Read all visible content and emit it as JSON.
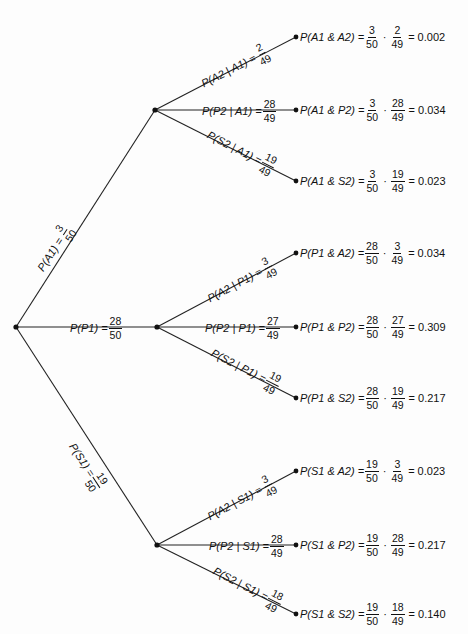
{
  "diagram": {
    "type": "probability-tree",
    "root": {
      "x": 16,
      "y": 327
    },
    "level1": [
      {
        "id": "A1",
        "node": {
          "x": 155,
          "y": 110
        },
        "label": {
          "prefix": "P(A1) =",
          "num": "3",
          "den": "50"
        }
      },
      {
        "id": "P1",
        "node": {
          "x": 157,
          "y": 327
        },
        "label": {
          "prefix": "P(P1) =",
          "num": "28",
          "den": "50"
        }
      },
      {
        "id": "S1",
        "node": {
          "x": 157,
          "y": 545
        },
        "label": {
          "prefix": "P(S1) =",
          "num": "19",
          "den": "50"
        }
      }
    ],
    "level2": [
      {
        "parent": "A1",
        "leaf": {
          "x": 296,
          "y": 37
        },
        "label": {
          "prefix": "P(A2 | A1) =",
          "num": "2",
          "den": "49"
        },
        "outcome": {
          "event": "P(A1 & A2) =",
          "f1n": "3",
          "f1d": "50",
          "f2n": "2",
          "f2d": "49",
          "result": "= 0.002"
        }
      },
      {
        "parent": "A1",
        "leaf": {
          "x": 296,
          "y": 110
        },
        "label": {
          "prefix": "P(P2 | A1) =",
          "num": "28",
          "den": "49"
        },
        "outcome": {
          "event": "P(A1 & P2) =",
          "f1n": "3",
          "f1d": "50",
          "f2n": "28",
          "f2d": "49",
          "result": "= 0.034"
        }
      },
      {
        "parent": "A1",
        "leaf": {
          "x": 296,
          "y": 181
        },
        "label": {
          "prefix": "P(S2 | A1) =",
          "num": "19",
          "den": "49"
        },
        "outcome": {
          "event": "P(A1 & S2) =",
          "f1n": "3",
          "f1d": "50",
          "f2n": "19",
          "f2d": "49",
          "result": "= 0.023"
        }
      },
      {
        "parent": "P1",
        "leaf": {
          "x": 296,
          "y": 253
        },
        "label": {
          "prefix": "P(A2 | P1) =",
          "num": "3",
          "den": "49"
        },
        "outcome": {
          "event": "P(P1 & A2) =",
          "f1n": "28",
          "f1d": "50",
          "f2n": "3",
          "f2d": "49",
          "result": "= 0.034"
        }
      },
      {
        "parent": "P1",
        "leaf": {
          "x": 296,
          "y": 327
        },
        "label": {
          "prefix": "P(P2 | P1) =",
          "num": "27",
          "den": "49"
        },
        "outcome": {
          "event": "P(P1 & P2) =",
          "f1n": "28",
          "f1d": "50",
          "f2n": "27",
          "f2d": "49",
          "result": "= 0.309"
        }
      },
      {
        "parent": "P1",
        "leaf": {
          "x": 296,
          "y": 398
        },
        "label": {
          "prefix": "P(S2 | P1) =",
          "num": "19",
          "den": "49"
        },
        "outcome": {
          "event": "P(P1 & S2) =",
          "f1n": "28",
          "f1d": "50",
          "f2n": "19",
          "f2d": "49",
          "result": "= 0.217"
        }
      },
      {
        "parent": "S1",
        "leaf": {
          "x": 296,
          "y": 471
        },
        "label": {
          "prefix": "P(A2 | S1) =",
          "num": "3",
          "den": "49"
        },
        "outcome": {
          "event": "P(S1 & A2) =",
          "f1n": "19",
          "f1d": "50",
          "f2n": "3",
          "f2d": "49",
          "result": "= 0.023"
        }
      },
      {
        "parent": "S1",
        "leaf": {
          "x": 296,
          "y": 545
        },
        "label": {
          "prefix": "P(P2 | S1) =",
          "num": "28",
          "den": "49"
        },
        "outcome": {
          "event": "P(S1 & P2) =",
          "f1n": "19",
          "f1d": "50",
          "f2n": "28",
          "f2d": "49",
          "result": "= 0.217"
        }
      },
      {
        "parent": "S1",
        "leaf": {
          "x": 296,
          "y": 614
        },
        "label": {
          "prefix": "P(S2 | S1) =",
          "num": "18",
          "den": "49"
        },
        "outcome": {
          "event": "P(S1 & S2) =",
          "f1n": "19",
          "f1d": "50",
          "f2n": "18",
          "f2d": "49",
          "result": "= 0.140"
        }
      }
    ],
    "colors": {
      "line": "#222222",
      "background": "#fdfdfd",
      "text": "#111111"
    }
  }
}
